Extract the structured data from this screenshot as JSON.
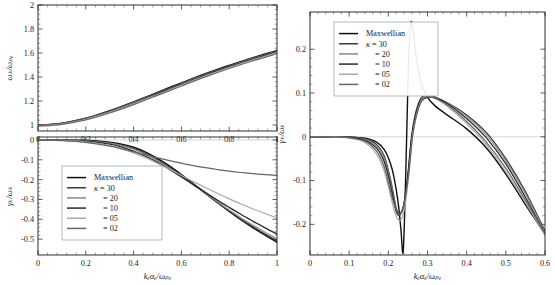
{
  "figure": {
    "background": "#ffffff",
    "foreground": "#1a1a1a"
  },
  "legend": {
    "entries": [
      {
        "label": "Maxwellian",
        "color": "#111111",
        "width": 1.6
      },
      {
        "label": "κ = 30",
        "color": "#3a3a3a",
        "width": 1.3
      },
      {
        "label": "= 20",
        "color": "#8a8a8a",
        "width": 1.2
      },
      {
        "label": "= 10",
        "color": "#2a2a2a",
        "width": 1.5
      },
      {
        "label": "= 05",
        "color": "#a8a8a8",
        "width": 1.2
      },
      {
        "label": "= 02",
        "color": "#666666",
        "width": 1.3
      }
    ]
  },
  "chart_data": [
    {
      "id": "dispersion",
      "type": "line",
      "title": "",
      "xlabel": "kₑαₑ/ωₚₑ",
      "ylabel": "ωₖ/ωₚₑ",
      "xlim": [
        0,
        1
      ],
      "ylim": [
        0.95,
        2
      ],
      "xticks": [
        0,
        0.2,
        0.4,
        0.6,
        0.8,
        1
      ],
      "xticklabels": [
        "0",
        "0.2",
        "0.4",
        "0.6",
        "0.8",
        "1"
      ],
      "yticks": [
        1,
        1.2,
        1.4,
        1.6,
        1.8,
        2
      ],
      "yticklabels": [
        "1",
        "1.2",
        "1.4",
        "1.6",
        "1.8",
        "2"
      ],
      "grid": false,
      "legend_position": "none",
      "series": [
        {
          "name": "Maxwellian",
          "color": "#111111",
          "width": 1.5,
          "x": [
            0,
            0.05,
            0.1,
            0.15,
            0.2,
            0.25,
            0.3,
            0.35,
            0.4,
            0.45,
            0.5,
            0.55,
            0.6,
            0.65,
            0.7,
            0.75,
            0.8,
            0.85,
            0.9,
            0.95,
            1.0
          ],
          "y": [
            1.0,
            1.004,
            1.015,
            1.033,
            1.057,
            1.086,
            1.119,
            1.155,
            1.193,
            1.232,
            1.272,
            1.312,
            1.351,
            1.39,
            1.427,
            1.463,
            1.497,
            1.53,
            1.561,
            1.591,
            1.62
          ]
        },
        {
          "name": "κ = 30",
          "color": "#3a3a3a",
          "width": 1.2,
          "x": [
            0,
            0.1,
            0.2,
            0.3,
            0.4,
            0.5,
            0.6,
            0.7,
            0.8,
            0.9,
            1.0
          ],
          "y": [
            0.999,
            1.014,
            1.055,
            1.117,
            1.19,
            1.268,
            1.347,
            1.423,
            1.493,
            1.557,
            1.616
          ]
        },
        {
          "name": "κ = 20",
          "color": "#8a8a8a",
          "width": 1.1,
          "x": [
            0,
            0.1,
            0.2,
            0.3,
            0.4,
            0.5,
            0.6,
            0.7,
            0.8,
            0.9,
            1.0
          ],
          "y": [
            0.998,
            1.013,
            1.053,
            1.115,
            1.187,
            1.265,
            1.344,
            1.42,
            1.49,
            1.554,
            1.613
          ]
        },
        {
          "name": "κ = 10",
          "color": "#2a2a2a",
          "width": 1.3,
          "x": [
            0,
            0.1,
            0.2,
            0.3,
            0.4,
            0.5,
            0.6,
            0.7,
            0.8,
            0.9,
            1.0
          ],
          "y": [
            0.997,
            1.012,
            1.051,
            1.112,
            1.183,
            1.261,
            1.34,
            1.416,
            1.486,
            1.55,
            1.609
          ]
        },
        {
          "name": "κ = 05",
          "color": "#a8a8a8",
          "width": 1.1,
          "x": [
            0,
            0.1,
            0.2,
            0.3,
            0.4,
            0.5,
            0.6,
            0.7,
            0.8,
            0.9,
            1.0
          ],
          "y": [
            0.995,
            1.01,
            1.048,
            1.108,
            1.178,
            1.255,
            1.334,
            1.41,
            1.48,
            1.544,
            1.603
          ]
        },
        {
          "name": "κ = 02",
          "color": "#666666",
          "width": 1.2,
          "x": [
            0,
            0.1,
            0.2,
            0.3,
            0.4,
            0.5,
            0.6,
            0.7,
            0.8,
            0.9,
            1.0
          ],
          "y": [
            0.99,
            1.005,
            1.042,
            1.1,
            1.17,
            1.247,
            1.325,
            1.401,
            1.471,
            1.535,
            1.594
          ]
        }
      ]
    },
    {
      "id": "damping",
      "type": "line",
      "title": "",
      "xlabel": "kₑαₑ/ωₚₑ",
      "ylabel": "γₖ/ωₖ",
      "xlim": [
        0,
        1
      ],
      "ylim": [
        -0.58,
        0.015
      ],
      "xticks": [
        0,
        0.2,
        0.4,
        0.6,
        0.8,
        1
      ],
      "xticklabels": [
        "0",
        "0.2",
        "0.4",
        "0.6",
        "0.8",
        "1"
      ],
      "yticks": [
        0,
        -0.1,
        -0.2,
        -0.3,
        -0.4,
        -0.5
      ],
      "yticklabels": [
        "0",
        "-0.1",
        "-0.2",
        "-0.3",
        "-0.4",
        "-0.5"
      ],
      "grid": false,
      "legend_position": "lower-left",
      "series": [
        {
          "name": "Maxwellian",
          "color": "#111111",
          "width": 1.5,
          "x": [
            0,
            0.1,
            0.2,
            0.3,
            0.35,
            0.4,
            0.45,
            0.5,
            0.55,
            0.6,
            0.65,
            0.7,
            0.75,
            0.8,
            0.85,
            0.9,
            0.95,
            1.0
          ],
          "y": [
            0.0,
            -0.0002,
            -0.002,
            -0.011,
            -0.021,
            -0.037,
            -0.061,
            -0.093,
            -0.131,
            -0.175,
            -0.221,
            -0.268,
            -0.315,
            -0.36,
            -0.403,
            -0.443,
            -0.48,
            -0.515
          ]
        },
        {
          "name": "κ = 30",
          "color": "#3a3a3a",
          "width": 1.25,
          "x": [
            0,
            0.1,
            0.2,
            0.3,
            0.35,
            0.4,
            0.45,
            0.5,
            0.55,
            0.6,
            0.65,
            0.7,
            0.75,
            0.8,
            0.85,
            0.9,
            0.95,
            1.0
          ],
          "y": [
            0.0,
            -0.0004,
            -0.003,
            -0.014,
            -0.026,
            -0.043,
            -0.068,
            -0.1,
            -0.138,
            -0.18,
            -0.225,
            -0.27,
            -0.315,
            -0.358,
            -0.4,
            -0.438,
            -0.474,
            -0.508
          ]
        },
        {
          "name": "κ = 20",
          "color": "#8a8a8a",
          "width": 1.15,
          "x": [
            0,
            0.1,
            0.2,
            0.3,
            0.35,
            0.4,
            0.45,
            0.5,
            0.55,
            0.6,
            0.65,
            0.7,
            0.75,
            0.8,
            0.85,
            0.9,
            0.95,
            1.0
          ],
          "y": [
            0.0,
            -0.0006,
            -0.004,
            -0.016,
            -0.029,
            -0.047,
            -0.073,
            -0.105,
            -0.142,
            -0.183,
            -0.226,
            -0.269,
            -0.312,
            -0.353,
            -0.393,
            -0.43,
            -0.465,
            -0.498
          ]
        },
        {
          "name": "κ = 10",
          "color": "#2a2a2a",
          "width": 1.35,
          "x": [
            0,
            0.1,
            0.2,
            0.3,
            0.35,
            0.4,
            0.45,
            0.5,
            0.55,
            0.6,
            0.65,
            0.7,
            0.75,
            0.8,
            0.85,
            0.9,
            0.95,
            1.0
          ],
          "y": [
            0.0,
            -0.001,
            -0.006,
            -0.021,
            -0.036,
            -0.056,
            -0.082,
            -0.113,
            -0.148,
            -0.186,
            -0.225,
            -0.264,
            -0.303,
            -0.34,
            -0.376,
            -0.41,
            -0.443,
            -0.474
          ]
        },
        {
          "name": "κ = 05",
          "color": "#a8a8a8",
          "width": 1.15,
          "x": [
            0,
            0.1,
            0.2,
            0.3,
            0.35,
            0.4,
            0.45,
            0.5,
            0.55,
            0.6,
            0.65,
            0.7,
            0.75,
            0.8,
            0.85,
            0.9,
            0.95,
            1.0
          ],
          "y": [
            0.0,
            -0.002,
            -0.009,
            -0.027,
            -0.044,
            -0.065,
            -0.09,
            -0.118,
            -0.148,
            -0.179,
            -0.21,
            -0.24,
            -0.269,
            -0.297,
            -0.323,
            -0.348,
            -0.371,
            -0.393
          ]
        },
        {
          "name": "κ = 02",
          "color": "#666666",
          "width": 1.25,
          "x": [
            0,
            0.1,
            0.2,
            0.3,
            0.35,
            0.4,
            0.45,
            0.5,
            0.55,
            0.6,
            0.65,
            0.7,
            0.75,
            0.8,
            0.85,
            0.9,
            0.95,
            1.0
          ],
          "y": [
            0.0,
            -0.003,
            -0.012,
            -0.031,
            -0.045,
            -0.06,
            -0.075,
            -0.09,
            -0.104,
            -0.117,
            -0.129,
            -0.14,
            -0.149,
            -0.157,
            -0.164,
            -0.17,
            -0.175,
            -0.179
          ]
        }
      ]
    },
    {
      "id": "growth",
      "type": "line",
      "title": "",
      "xlabel": "kₑαₑ/ωₚₑ",
      "ylabel": "γₖ/ωₖ",
      "xlim": [
        0,
        0.6
      ],
      "ylim": [
        -0.27,
        0.285
      ],
      "xticks": [
        0,
        0.1,
        0.2,
        0.3,
        0.4,
        0.5,
        0.6
      ],
      "xticklabels": [
        "0",
        "0.1",
        "0.2",
        "0.3",
        "0.4",
        "0.5",
        "0.6"
      ],
      "yticks": [
        0.2,
        0.1,
        0,
        -0.1,
        -0.2
      ],
      "yticklabels": [
        "0.2",
        "0.1",
        "0",
        "-0.1",
        "-0.2"
      ],
      "grid": false,
      "legend_position": "upper-left",
      "series": [
        {
          "name": "Maxwellian",
          "color": "#111111",
          "width": 1.4,
          "x": [
            0,
            0.05,
            0.1,
            0.14,
            0.17,
            0.19,
            0.205,
            0.215,
            0.225,
            0.232,
            0.238,
            0.244,
            0.25,
            0.254,
            0.258,
            0.262,
            0.268,
            0.275,
            0.285,
            0.3,
            0.32,
            0.35,
            0.4,
            0.45,
            0.5,
            0.55,
            0.6
          ],
          "y": [
            0.0,
            0.0,
            -0.0005,
            -0.003,
            -0.012,
            -0.03,
            -0.06,
            -0.095,
            -0.15,
            -0.21,
            -0.262,
            -0.1,
            0.12,
            0.225,
            0.262,
            0.25,
            0.205,
            0.16,
            0.12,
            0.09,
            0.07,
            0.05,
            0.018,
            -0.025,
            -0.085,
            -0.155,
            -0.222
          ]
        },
        {
          "name": "κ = 30",
          "color": "#3a3a3a",
          "width": 1.25,
          "x": [
            0,
            0.05,
            0.1,
            0.14,
            0.17,
            0.19,
            0.205,
            0.215,
            0.222,
            0.23,
            0.24,
            0.25,
            0.26,
            0.272,
            0.285,
            0.3,
            0.32,
            0.35,
            0.4,
            0.45,
            0.5,
            0.55,
            0.6
          ],
          "y": [
            0.0,
            0.0,
            -0.0008,
            -0.005,
            -0.018,
            -0.045,
            -0.095,
            -0.14,
            -0.168,
            -0.175,
            -0.155,
            -0.09,
            0.0,
            0.055,
            0.082,
            0.09,
            0.088,
            0.078,
            0.05,
            0.01,
            -0.05,
            -0.125,
            -0.215
          ]
        },
        {
          "name": "κ = 20",
          "color": "#8a8a8a",
          "width": 1.15,
          "x": [
            0,
            0.05,
            0.1,
            0.14,
            0.17,
            0.19,
            0.205,
            0.215,
            0.222,
            0.23,
            0.24,
            0.25,
            0.26,
            0.272,
            0.285,
            0.3,
            0.32,
            0.35,
            0.4,
            0.45,
            0.5,
            0.55,
            0.6
          ],
          "y": [
            0.0,
            0.0,
            -0.001,
            -0.006,
            -0.021,
            -0.05,
            -0.1,
            -0.145,
            -0.172,
            -0.178,
            -0.156,
            -0.09,
            0.002,
            0.058,
            0.086,
            0.093,
            0.09,
            0.078,
            0.047,
            0.005,
            -0.055,
            -0.13,
            -0.218
          ]
        },
        {
          "name": "κ = 10",
          "color": "#2a2a2a",
          "width": 1.35,
          "x": [
            0,
            0.05,
            0.1,
            0.14,
            0.17,
            0.19,
            0.205,
            0.215,
            0.222,
            0.23,
            0.24,
            0.25,
            0.26,
            0.272,
            0.285,
            0.3,
            0.32,
            0.35,
            0.4,
            0.45,
            0.5,
            0.55,
            0.6
          ],
          "y": [
            0.0,
            0.0,
            -0.0015,
            -0.008,
            -0.026,
            -0.058,
            -0.108,
            -0.152,
            -0.175,
            -0.178,
            -0.152,
            -0.085,
            0.005,
            0.062,
            0.09,
            0.095,
            0.09,
            0.076,
            0.042,
            -0.002,
            -0.062,
            -0.138,
            -0.222
          ]
        },
        {
          "name": "κ = 05",
          "color": "#a8a8a8",
          "width": 1.15,
          "x": [
            0,
            0.05,
            0.1,
            0.14,
            0.17,
            0.19,
            0.205,
            0.215,
            0.222,
            0.232,
            0.242,
            0.252,
            0.262,
            0.275,
            0.288,
            0.3,
            0.32,
            0.35,
            0.4,
            0.45,
            0.5,
            0.55,
            0.6
          ],
          "y": [
            0.0,
            0.0,
            -0.003,
            -0.013,
            -0.04,
            -0.08,
            -0.132,
            -0.168,
            -0.185,
            -0.19,
            -0.16,
            -0.09,
            0.005,
            0.06,
            0.088,
            0.094,
            0.088,
            0.07,
            0.03,
            -0.018,
            -0.08,
            -0.15,
            -0.225
          ]
        },
        {
          "name": "κ = 02",
          "color": "#666666",
          "width": 1.25,
          "x": [
            0,
            0.05,
            0.1,
            0.14,
            0.17,
            0.19,
            0.2,
            0.21,
            0.22,
            0.228,
            0.24,
            0.252,
            0.263,
            0.276,
            0.29,
            0.305,
            0.325,
            0.355,
            0.4,
            0.45,
            0.5,
            0.55,
            0.6
          ],
          "y": [
            0.0,
            0.0,
            -0.002,
            -0.01,
            -0.033,
            -0.07,
            -0.105,
            -0.14,
            -0.166,
            -0.178,
            -0.155,
            -0.085,
            0.008,
            0.062,
            0.088,
            0.092,
            0.086,
            0.07,
            0.035,
            -0.012,
            -0.072,
            -0.145,
            -0.22
          ]
        }
      ]
    }
  ]
}
